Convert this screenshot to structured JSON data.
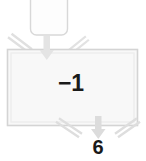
{
  "diagram": {
    "type": "flowchart",
    "background_color": "#ffffff",
    "stroke_color": "#d6d6d6",
    "fill_color": "#f8f8f8",
    "text_color": "#1a1a1a",
    "nodes": [
      {
        "id": "top-node",
        "shape": "rounded-rectangle",
        "label": "",
        "x": 30,
        "y": -8,
        "width": 38,
        "height": 43,
        "clipped_at_top": true
      },
      {
        "id": "main-node",
        "shape": "rectangle",
        "label": "−1",
        "x": 7,
        "y": 49,
        "width": 131,
        "height": 77
      }
    ],
    "connectors": [
      {
        "id": "top-input-arrow",
        "kind": "arrow",
        "direction": "down",
        "x": 47,
        "y_from": 36,
        "y_to": 56
      },
      {
        "id": "top-left-chevron",
        "kind": "chevron",
        "direction": "down-right",
        "x": 10,
        "y": 38
      },
      {
        "id": "top-right-chevron",
        "kind": "chevron",
        "direction": "down-left",
        "x": 70,
        "y": 38
      },
      {
        "id": "bottom-output-arrow",
        "kind": "arrow",
        "direction": "down",
        "x": 98,
        "y_from": 117,
        "y_to": 137
      },
      {
        "id": "bottom-left-chevron",
        "kind": "chevron",
        "direction": "down-right",
        "x": 62,
        "y": 120
      },
      {
        "id": "bottom-right-chevron",
        "kind": "chevron",
        "direction": "down-left",
        "x": 108,
        "y": 120
      }
    ],
    "labels": {
      "main_value": "−1",
      "output_count": "6"
    }
  }
}
